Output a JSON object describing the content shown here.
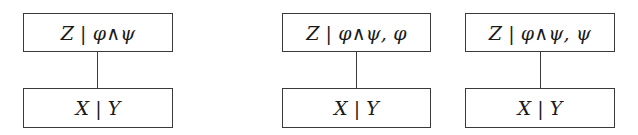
{
  "diagrams": [
    {
      "top": {
        "left": "Z",
        "separator": "|",
        "right": "φ∧ψ"
      },
      "bottom": {
        "left": "X",
        "separator": "|",
        "right": "Y"
      }
    },
    {
      "top": {
        "left": "Z",
        "separator": "|",
        "right": "φ∧ψ, φ"
      },
      "bottom": {
        "left": "X",
        "separator": "|",
        "right": "Y"
      }
    },
    {
      "top": {
        "left": "Z",
        "separator": "|",
        "right": "φ∧ψ, ψ"
      },
      "bottom": {
        "left": "X",
        "separator": "|",
        "right": "Y"
      }
    }
  ],
  "colors": {
    "border": "#3a3a3a",
    "text": "#1a1a1a",
    "background": "#ffffff"
  }
}
